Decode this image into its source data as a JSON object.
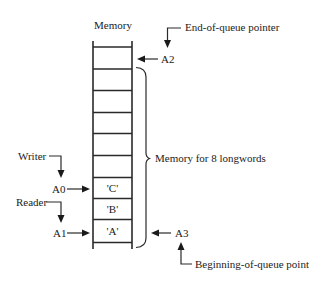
{
  "diagram": {
    "title": "Memory",
    "cells": [
      "",
      "",
      "",
      "",
      "",
      "",
      "'C'",
      "'B'",
      "'A'"
    ],
    "brace_label": "Memory for 8 longwords",
    "pointers": {
      "end_of_queue": {
        "register": "A2",
        "caption": "End-of-queue pointer"
      },
      "beginning_of_queue": {
        "register": "A3",
        "caption": "Beginning-of-queue pointer"
      },
      "writer": {
        "register": "A0",
        "caption": "Writer"
      },
      "reader": {
        "register": "A1",
        "caption": "Reader"
      }
    },
    "colors": {
      "ink": "#222222",
      "background": "#ffffff"
    }
  }
}
